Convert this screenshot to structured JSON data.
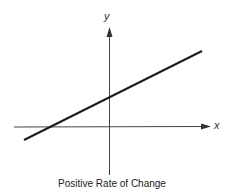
{
  "diagram": {
    "caption": "Positive Rate of Change",
    "x_axis_label": "x",
    "y_axis_label": "y",
    "line_type": "straight line with positive slope",
    "line_crosses": {
      "x_axis": "negative x",
      "y_axis": "positive y"
    },
    "colors": {
      "line": "#1a1a1a",
      "axis": "#444444",
      "background": "#ffffff"
    }
  }
}
